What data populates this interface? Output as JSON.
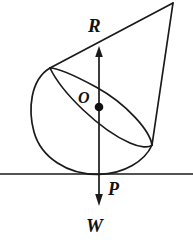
{
  "figure": {
    "canvas": {
      "width": 193,
      "height": 243,
      "background": "#ffffff"
    },
    "stroke_color": "#1a1a1a",
    "labels": {
      "reaction": "R",
      "center": "O",
      "contact_point": "P",
      "weight": "W"
    },
    "parts": {
      "ground_line": "ground-line",
      "hemisphere": "hemisphere-arc",
      "ellipse_rim": "ellipse-rim",
      "cone_left_edge": "cone-left-edge",
      "cone_right_edge": "cone-right-edge",
      "reaction_arrow": "reaction-force-arrow",
      "weight_arrow": "weight-force-arrow",
      "center_dot": "center-of-mass-dot"
    },
    "geometry": {
      "apex": [
        173,
        3
      ],
      "rim_left": [
        50,
        68
      ],
      "rim_right": [
        152,
        145
      ],
      "hemisphere_leftmost": [
        31,
        122
      ],
      "ground_y": 174,
      "axis_x": 99,
      "reaction_arrow_tip_y": 48,
      "weight_arrow_tip_y": 205,
      "center_dot": [
        99,
        107
      ]
    }
  }
}
